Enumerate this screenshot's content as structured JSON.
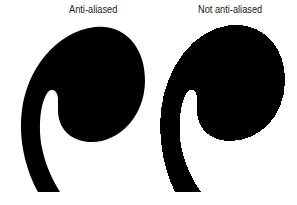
{
  "labels": {
    "left": "Anti-aliased",
    "right": "Not anti-aliased"
  },
  "glyph": {
    "name": "quote-mark-comma-shape",
    "fill": "#000000",
    "background": "#ffffff"
  }
}
